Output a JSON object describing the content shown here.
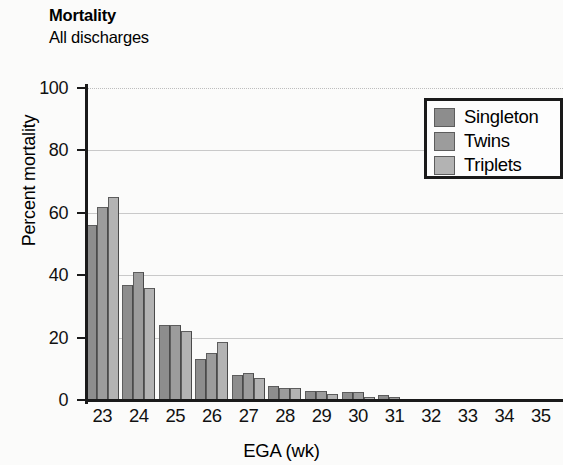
{
  "figure": {
    "title": "Mortality",
    "subtitle": "All discharges"
  },
  "chart_data": {
    "type": "bar",
    "title": "Mortality",
    "subtitle": "All discharges",
    "xlabel": "EGA (wk)",
    "ylabel": "Percent mortality",
    "categories": [
      "23",
      "24",
      "25",
      "26",
      "27",
      "28",
      "29",
      "30",
      "31",
      "32",
      "33",
      "34",
      "35"
    ],
    "series": [
      {
        "name": "Singleton",
        "color": "#8d8d8d",
        "values": [
          56,
          37,
          24,
          13,
          8,
          4.5,
          3,
          2.5,
          1.5,
          0,
          0,
          0,
          0
        ]
      },
      {
        "name": "Twins",
        "color": "#9c9c9c",
        "values": [
          62,
          41,
          24,
          15,
          8.5,
          4,
          3,
          2.5,
          1,
          0,
          0,
          0,
          0
        ]
      },
      {
        "name": "Triplets",
        "color": "#b3b3b3",
        "values": [
          65,
          36,
          22,
          18.5,
          7,
          4,
          2,
          1,
          0,
          0,
          0,
          0,
          0
        ]
      }
    ],
    "ylim": [
      0,
      100
    ],
    "yticks": [
      0,
      20,
      40,
      60,
      80,
      100
    ],
    "grid": true,
    "legend_position": "top-right"
  },
  "legend": {
    "items": [
      {
        "label": "Singleton"
      },
      {
        "label": "Twins"
      },
      {
        "label": "Triplets"
      }
    ]
  },
  "axes": {
    "y": {
      "label": "Percent mortality",
      "ticks": [
        "100",
        "80",
        "60",
        "40",
        "20",
        "0"
      ]
    },
    "x": {
      "label": "EGA (wk)",
      "ticks": [
        "23",
        "24",
        "25",
        "26",
        "27",
        "28",
        "29",
        "30",
        "31",
        "32",
        "33",
        "34",
        "35"
      ]
    }
  }
}
